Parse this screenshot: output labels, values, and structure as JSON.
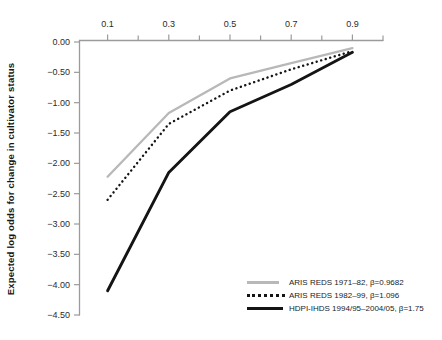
{
  "chart_data": {
    "type": "line",
    "title": "",
    "xlabel": "",
    "ylabel": "Expected log odds for change in cultivator status",
    "x_axis": {
      "position": "top",
      "min": 0,
      "max": 1,
      "major_ticks": [
        0.1,
        0.3,
        0.5,
        0.7,
        0.9
      ],
      "major_tick_labels": [
        "0.1",
        "0.3",
        "0.5",
        "0.7",
        "0.9"
      ],
      "minor_ticks": [
        0.2,
        0.4,
        0.6,
        0.8,
        1.0
      ]
    },
    "y_axis": {
      "min": -4.5,
      "max": 0,
      "ticks": [
        0,
        -0.5,
        -1,
        -1.5,
        -2,
        -2.5,
        -3,
        -3.5,
        -4,
        -4.5
      ],
      "tick_labels": [
        "0.00",
        "−0.50",
        "−1.00",
        "−1.50",
        "−2.00",
        "−2.50",
        "−3.00",
        "−3.50",
        "−4.00",
        "−4.50"
      ]
    },
    "grid": false,
    "legend_position": "bottom-right",
    "x": [
      0.1,
      0.3,
      0.5,
      0.7,
      0.9
    ],
    "series": [
      {
        "name": "ARIS REDS 1971-82",
        "label": "ARIS REDS 1971–82, β=0.9682",
        "style": "solid",
        "color": "#b8b8b8",
        "stroke_width": 2.3,
        "values": [
          -2.22,
          -1.17,
          -0.6,
          -0.35,
          -0.1
        ]
      },
      {
        "name": "ARIS REDS 1982-99",
        "label": "ARIS REDS 1982–99, β=1.096",
        "style": "dotted",
        "color": "#141414",
        "stroke_width": 2.4,
        "values": [
          -2.6,
          -1.35,
          -0.8,
          -0.45,
          -0.15
        ]
      },
      {
        "name": "HDPI-IHDS 1994/95-2004/05",
        "label": "HDPI-IHDS 1994/95–2004/05, β=1.75",
        "style": "solid",
        "color": "#141414",
        "stroke_width": 2.9,
        "values": [
          -4.1,
          -2.15,
          -1.15,
          -0.7,
          -0.17
        ]
      }
    ]
  }
}
